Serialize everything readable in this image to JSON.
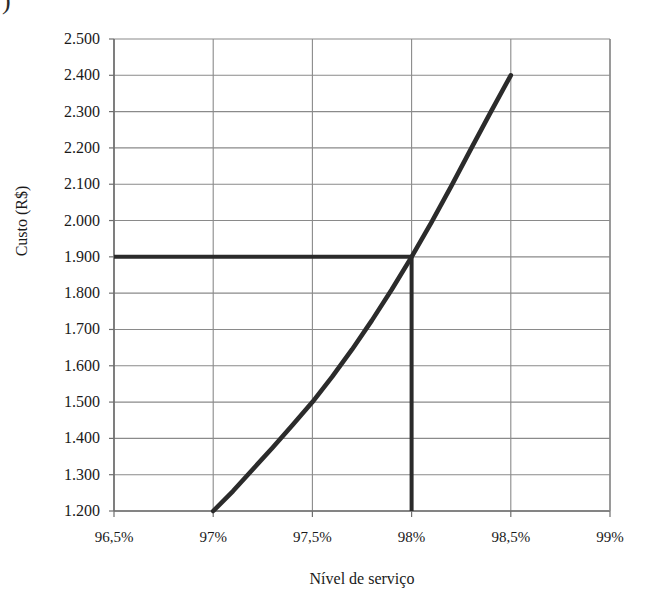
{
  "figure": {
    "corner_artifact": ")"
  },
  "chart_data": {
    "type": "line",
    "title": "",
    "xlabel": "Nível de serviço",
    "ylabel": "Custo (R$)",
    "x_tick_labels": [
      "96,5%",
      "97%",
      "97,5%",
      "98%",
      "98,5%",
      "99%"
    ],
    "x_tick_values": [
      96.5,
      97.0,
      97.5,
      98.0,
      98.5,
      99.0
    ],
    "y_tick_labels": [
      "1.200",
      "1.300",
      "1.400",
      "1.500",
      "1.600",
      "1.700",
      "1.800",
      "1.900",
      "2.000",
      "2.100",
      "2.200",
      "2.300",
      "2.400",
      "2.500"
    ],
    "y_tick_values": [
      1200,
      1300,
      1400,
      1500,
      1600,
      1700,
      1800,
      1900,
      2000,
      2100,
      2200,
      2300,
      2400,
      2500
    ],
    "xlim": [
      96.5,
      99.0
    ],
    "ylim": [
      1200,
      2500
    ],
    "grid": true,
    "legend": false,
    "series": [
      {
        "name": "Custo",
        "x": [
          97.0,
          97.1,
          97.2,
          97.3,
          97.4,
          97.5,
          97.6,
          97.7,
          97.8,
          97.9,
          98.0,
          98.1,
          98.2,
          98.3,
          98.4,
          98.5
        ],
        "values": [
          1200,
          1255,
          1315,
          1375,
          1437,
          1500,
          1570,
          1645,
          1725,
          1810,
          1900,
          1995,
          2095,
          2198,
          2300,
          2400
        ]
      }
    ],
    "annotations": [
      {
        "name": "operating-point",
        "x": 98.0,
        "y": 1900,
        "horizontal_reference_from_x": 96.5,
        "vertical_reference_to_y": 1200
      }
    ],
    "colors": {
      "curve": "#2b2b2b",
      "reference_line": "#2b2b2b",
      "grid": "#8a8a8a",
      "axis": "#6f6f6f",
      "background": "#ffffff"
    }
  }
}
